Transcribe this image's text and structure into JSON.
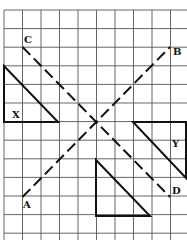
{
  "diagram": {
    "grid": {
      "x0": 4,
      "y0": 10,
      "cell_w": 18.5,
      "cell_h": 18.6,
      "cols": 10,
      "rows": 12
    },
    "lines": [
      {
        "name": "line-AB",
        "from": "A",
        "to": "B",
        "style": "dashed"
      },
      {
        "name": "line-CD",
        "from": "C",
        "to": "D",
        "style": "dashed"
      }
    ],
    "points": {
      "A": {
        "label": "A"
      },
      "B": {
        "label": "B"
      },
      "C": {
        "label": "C"
      },
      "D": {
        "label": "D"
      }
    },
    "shapes": [
      {
        "name": "triangle-X",
        "label": "X"
      },
      {
        "name": "triangle-Y",
        "label": "Y"
      },
      {
        "name": "triangle-unlabeled",
        "label": ""
      }
    ]
  }
}
